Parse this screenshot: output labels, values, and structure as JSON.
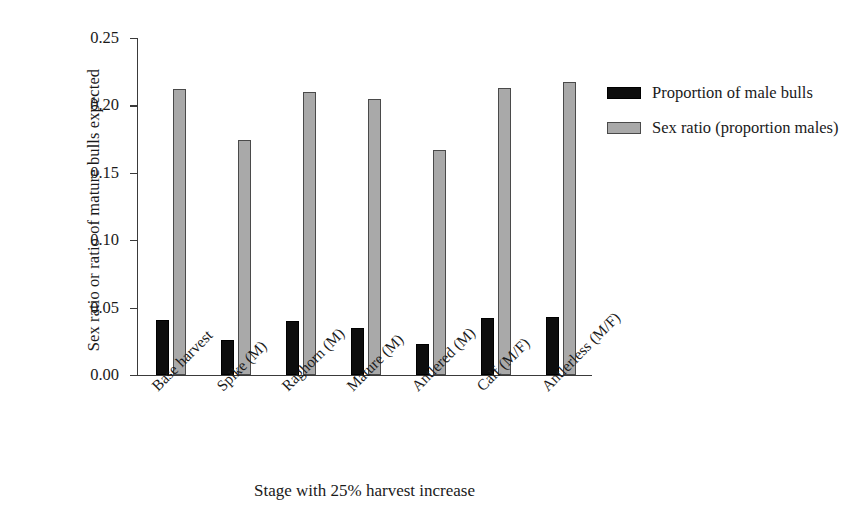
{
  "chart_data": {
    "type": "bar",
    "title": "",
    "xlabel": "Stage with 25% harvest increase",
    "ylabel": "Sex ratio or ratio of mature bulls expected",
    "ylim": [
      0.0,
      0.25
    ],
    "yticks": [
      "0.00",
      "0.05",
      "0.10",
      "0.15",
      "0.20",
      "0.25"
    ],
    "ytick_values": [
      0.0,
      0.05,
      0.1,
      0.15,
      0.2,
      0.25
    ],
    "grid": false,
    "legend_position": "right",
    "categories": [
      "Base harvest",
      "Spike (M)",
      "Raghorn (M)",
      "Mature (M)",
      "Antlered (M)",
      "Calf (M/F)",
      "Antlerless (M/F)"
    ],
    "series": [
      {
        "name": "Proportion of male bulls",
        "color": "#0d0d0d",
        "values": [
          0.041,
          0.026,
          0.04,
          0.035,
          0.023,
          0.042,
          0.043
        ]
      },
      {
        "name": "Sex ratio (proportion males)",
        "color": "#a9a9a9",
        "values": [
          0.212,
          0.174,
          0.21,
          0.205,
          0.167,
          0.213,
          0.217
        ]
      }
    ]
  },
  "legend": {
    "entries": [
      {
        "label": "Proportion of male bulls",
        "swatch": "black-swatch"
      },
      {
        "label": "Sex ratio (proportion males)",
        "swatch": "gray-swatch"
      }
    ]
  }
}
